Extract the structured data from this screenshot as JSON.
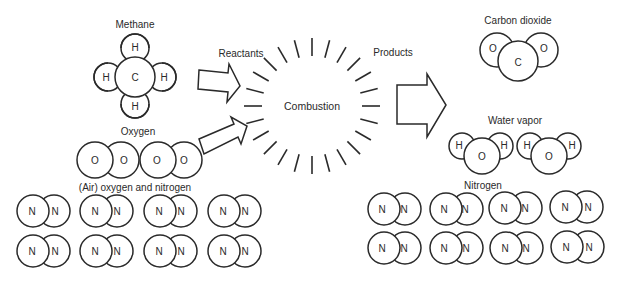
{
  "diagram": {
    "labels": {
      "methane": "Methane",
      "oxygen": "Oxygen",
      "air": "(Air) oxygen and nitrogen",
      "reactants": "Reactants",
      "combustion": "Combustion",
      "products": "Products",
      "carbon_dioxide": "Carbon dioxide",
      "water_vapor": "Water vapor",
      "nitrogen": "Nitrogen"
    },
    "symbols": {
      "hydrogen": "H",
      "carbon": "C",
      "oxygen": "O",
      "nitrogen": "N"
    },
    "colors": {
      "stroke": "#2a2a2a",
      "background": "#ffffff"
    },
    "reactants": {
      "methane_molecules": 1,
      "oxygen_molecules": 2,
      "nitrogen_molecules": 8
    },
    "products": {
      "carbon_dioxide_molecules": 1,
      "water_molecules": 2,
      "nitrogen_molecules": 8
    }
  }
}
